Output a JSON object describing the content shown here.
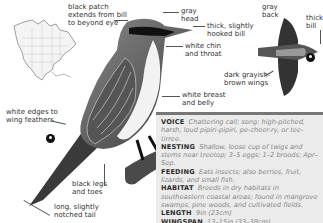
{
  "labels": {
    "black_patch": [
      "black patch",
      "extends from bill",
      "to beyond eye"
    ],
    "gray_head": [
      "gray",
      "head"
    ],
    "hooked_bill": [
      "thick, slightly",
      "hooked bill"
    ],
    "chin_throat": [
      "white chin",
      "and throat"
    ],
    "wing_edges": [
      "white edges to",
      "wing feathers"
    ],
    "breast_belly": [
      "white breast",
      "and belly"
    ],
    "legs_toes": [
      "black legs",
      "and toes"
    ],
    "tail": [
      "long, slightly",
      "notched tail"
    ],
    "gray_back": [
      "gray",
      "back"
    ],
    "thick_bill": [
      "thick",
      "bill"
    ],
    "dark_wings": [
      "dark grayish-",
      "brown wings"
    ]
  },
  "info": {
    "voice": {
      "label": "VOICE",
      "text": "Chattering call; song: high-pitched, harsh, loud pipiri-pipiri, pe-cheer-ry, or tee-tirree."
    },
    "nesting": {
      "label": "NESTING",
      "text": "Shallow, loose cup of twigs and stems near treetop; 3–5 eggs; 1–2 broods; Apr–Sep."
    },
    "feeding": {
      "label": "FEEDING",
      "text": "Eats insects; also berries, fruit, lizards, and small fish."
    },
    "habitat": {
      "label": "HABITAT",
      "text": "Breeds in dry habitats in southeastern coastal areas; found in mangrove swamps, pine woods, and cultivated fields."
    },
    "length": {
      "label": "LENGTH",
      "text": "9in (23cm)"
    },
    "wingspan": {
      "label": "WINGSPAN",
      "text": "13–15in (33–38cm)"
    }
  },
  "colors": {
    "panel_bg": "#ebebeb",
    "panel_rule": "#777777",
    "label_text": "#333333"
  },
  "icons": [
    "range-map-icon",
    "perched-bird-illustration",
    "flying-bird-illustration",
    "view-marker-icon"
  ]
}
